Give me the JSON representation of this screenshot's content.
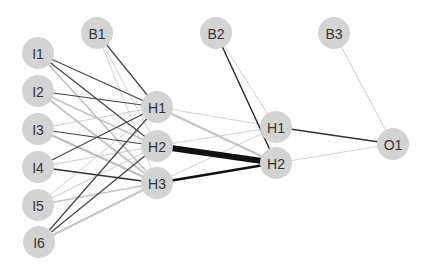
{
  "diagram": {
    "type": "neural-network",
    "node_color": "#d3d3d3",
    "node_radius": 16,
    "label_color": "#333333",
    "nodes": [
      {
        "id": "I1",
        "label": "I1",
        "layer": "input",
        "x": 38,
        "y": 53
      },
      {
        "id": "I2",
        "label": "I2",
        "layer": "input",
        "x": 38,
        "y": 91
      },
      {
        "id": "I3",
        "label": "I3",
        "layer": "input",
        "x": 38,
        "y": 129
      },
      {
        "id": "I4",
        "label": "I4",
        "layer": "input",
        "x": 38,
        "y": 167
      },
      {
        "id": "I5",
        "label": "I5",
        "layer": "input",
        "x": 38,
        "y": 205
      },
      {
        "id": "I6",
        "label": "I6",
        "layer": "input",
        "x": 39,
        "y": 242
      },
      {
        "id": "B1",
        "label": "B1",
        "layer": "bias1",
        "x": 97,
        "y": 33
      },
      {
        "id": "H1a",
        "label": "H1",
        "layer": "hidden1",
        "x": 157,
        "y": 107
      },
      {
        "id": "H2a",
        "label": "H2",
        "layer": "hidden1",
        "x": 157,
        "y": 146
      },
      {
        "id": "H3a",
        "label": "H3",
        "layer": "hidden1",
        "x": 157,
        "y": 183
      },
      {
        "id": "B2",
        "label": "B2",
        "layer": "bias2",
        "x": 216,
        "y": 33
      },
      {
        "id": "H1b",
        "label": "H1",
        "layer": "hidden2",
        "x": 276,
        "y": 127
      },
      {
        "id": "H2b",
        "label": "H2",
        "layer": "hidden2",
        "x": 276,
        "y": 163
      },
      {
        "id": "B3",
        "label": "B3",
        "layer": "bias3",
        "x": 334,
        "y": 33
      },
      {
        "id": "O1",
        "label": "O1",
        "layer": "output",
        "x": 393,
        "y": 144
      }
    ],
    "edges": [
      {
        "from": "I1",
        "to": "H1a",
        "color": "#444444",
        "width": 1.2
      },
      {
        "from": "I1",
        "to": "H2a",
        "color": "#444444",
        "width": 1.2
      },
      {
        "from": "I1",
        "to": "H3a",
        "color": "#bbbbbb",
        "width": 1.2
      },
      {
        "from": "I2",
        "to": "H1a",
        "color": "#444444",
        "width": 1.2
      },
      {
        "from": "I2",
        "to": "H2a",
        "color": "#c4c4c4",
        "width": 1.6
      },
      {
        "from": "I2",
        "to": "H3a",
        "color": "#c4c4c4",
        "width": 1.8
      },
      {
        "from": "I3",
        "to": "H1a",
        "color": "#cccccc",
        "width": 1
      },
      {
        "from": "I3",
        "to": "H2a",
        "color": "#444444",
        "width": 1.2
      },
      {
        "from": "I3",
        "to": "H3a",
        "color": "#bdbdbd",
        "width": 2
      },
      {
        "from": "I4",
        "to": "H1a",
        "color": "#444444",
        "width": 1.2
      },
      {
        "from": "I4",
        "to": "H2a",
        "color": "#cccccc",
        "width": 1
      },
      {
        "from": "I4",
        "to": "H3a",
        "color": "#333333",
        "width": 1.4
      },
      {
        "from": "I5",
        "to": "H1a",
        "color": "#d0d0d0",
        "width": 1
      },
      {
        "from": "I5",
        "to": "H2a",
        "color": "#cccccc",
        "width": 1
      },
      {
        "from": "I5",
        "to": "H3a",
        "color": "#c4c4c4",
        "width": 1.6
      },
      {
        "from": "I6",
        "to": "H1a",
        "color": "#444444",
        "width": 1.2
      },
      {
        "from": "I6",
        "to": "H2a",
        "color": "#444444",
        "width": 1.2
      },
      {
        "from": "I6",
        "to": "H3a",
        "color": "#c8c8c8",
        "width": 2.2
      },
      {
        "from": "B1",
        "to": "H1a",
        "color": "#444444",
        "width": 1.2
      },
      {
        "from": "B1",
        "to": "H2a",
        "color": "#d0d0d0",
        "width": 1
      },
      {
        "from": "B1",
        "to": "H3a",
        "color": "#d0d0d0",
        "width": 1
      },
      {
        "from": "H1a",
        "to": "H1b",
        "color": "#d0d0d0",
        "width": 1
      },
      {
        "from": "H1a",
        "to": "H2b",
        "color": "#c4c4c4",
        "width": 2.2
      },
      {
        "from": "H2a",
        "to": "H1b",
        "color": "#d0d0d0",
        "width": 1
      },
      {
        "from": "H2a",
        "to": "H2b",
        "color": "#111111",
        "width": 6
      },
      {
        "from": "H3a",
        "to": "H1b",
        "color": "#d0d0d0",
        "width": 1
      },
      {
        "from": "H3a",
        "to": "H2b",
        "color": "#111111",
        "width": 2.4
      },
      {
        "from": "B2",
        "to": "H1b",
        "color": "#d0d0d0",
        "width": 1
      },
      {
        "from": "B2",
        "to": "H2b",
        "color": "#222222",
        "width": 1.4
      },
      {
        "from": "H1b",
        "to": "O1",
        "color": "#333333",
        "width": 1.3
      },
      {
        "from": "H2b",
        "to": "O1",
        "color": "#d0d0d0",
        "width": 1
      },
      {
        "from": "B3",
        "to": "O1",
        "color": "#cccccc",
        "width": 1
      }
    ]
  }
}
